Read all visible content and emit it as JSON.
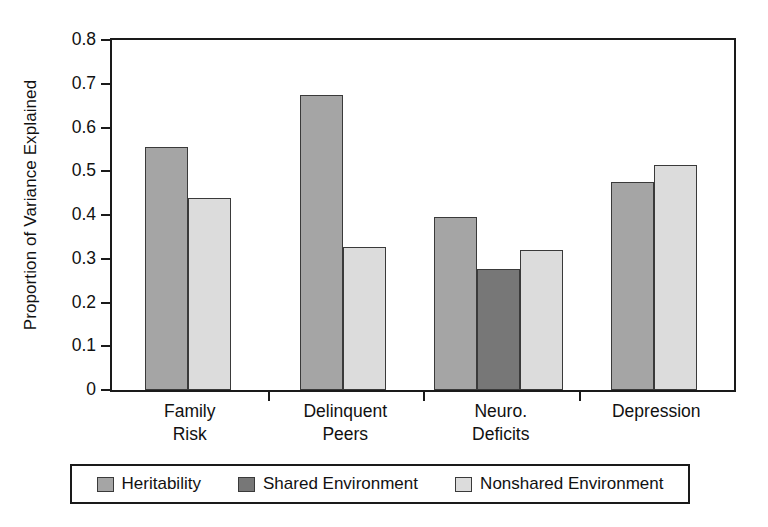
{
  "chart_data": {
    "type": "bar",
    "title": "",
    "xlabel": "",
    "ylabel": "Proportion of Variance Explained",
    "ylim": [
      0,
      0.8
    ],
    "ytick_labels": [
      "0.8",
      "0.7",
      "0.6",
      "0.5",
      "0.4",
      "0.3",
      "0.2",
      "0.1",
      "0"
    ],
    "ytick_values": [
      0.8,
      0.7,
      0.6,
      0.5,
      0.4,
      0.3,
      0.2,
      0.1,
      0
    ],
    "grid": false,
    "legend_position": "bottom",
    "categories": [
      "Family Risk",
      "Delinquent Peers",
      "Neuro. Deficits",
      "Depression"
    ],
    "category_lines": [
      [
        "Family",
        "Risk"
      ],
      [
        "Delinquent",
        "Peers"
      ],
      [
        "Neuro.",
        "Deficits"
      ],
      [
        "Depression",
        ""
      ]
    ],
    "series": [
      {
        "name": "Heritability",
        "color": "#a5a5a5",
        "values": [
          0.555,
          0.675,
          0.395,
          0.475
        ]
      },
      {
        "name": "Shared Environment",
        "color": "#777777",
        "values": [
          null,
          null,
          0.277,
          null
        ]
      },
      {
        "name": "Nonshared Environment",
        "color": "#dcdcdc",
        "values": [
          0.438,
          0.327,
          0.32,
          0.515
        ]
      }
    ],
    "bars": [
      {
        "group": "Family Risk",
        "series": "Heritability",
        "value": 0.555
      },
      {
        "group": "Family Risk",
        "series": "Nonshared Environment",
        "value": 0.438
      },
      {
        "group": "Delinquent Peers",
        "series": "Heritability",
        "value": 0.675
      },
      {
        "group": "Delinquent Peers",
        "series": "Nonshared Environment",
        "value": 0.327
      },
      {
        "group": "Neuro. Deficits",
        "series": "Heritability",
        "value": 0.395
      },
      {
        "group": "Neuro. Deficits",
        "series": "Shared Environment",
        "value": 0.277
      },
      {
        "group": "Neuro. Deficits",
        "series": "Nonshared Environment",
        "value": 0.32
      },
      {
        "group": "Depression",
        "series": "Heritability",
        "value": 0.475
      },
      {
        "group": "Depression",
        "series": "Nonshared Environment",
        "value": 0.515
      }
    ]
  },
  "legend": {
    "items": [
      {
        "label": "Heritability",
        "color": "#a5a5a5"
      },
      {
        "label": "Shared Environment",
        "color": "#777777"
      },
      {
        "label": "Nonshared Environment",
        "color": "#dcdcdc"
      }
    ]
  },
  "axis": {
    "y_title": "Proportion of Variance Explained"
  },
  "colors": {
    "heritability": "#a5a5a5",
    "shared_environment": "#777777",
    "nonshared_environment": "#dcdcdc",
    "axis": "#1a1a1a",
    "bar_outline": "#3a3a3a",
    "background": "#ffffff"
  }
}
